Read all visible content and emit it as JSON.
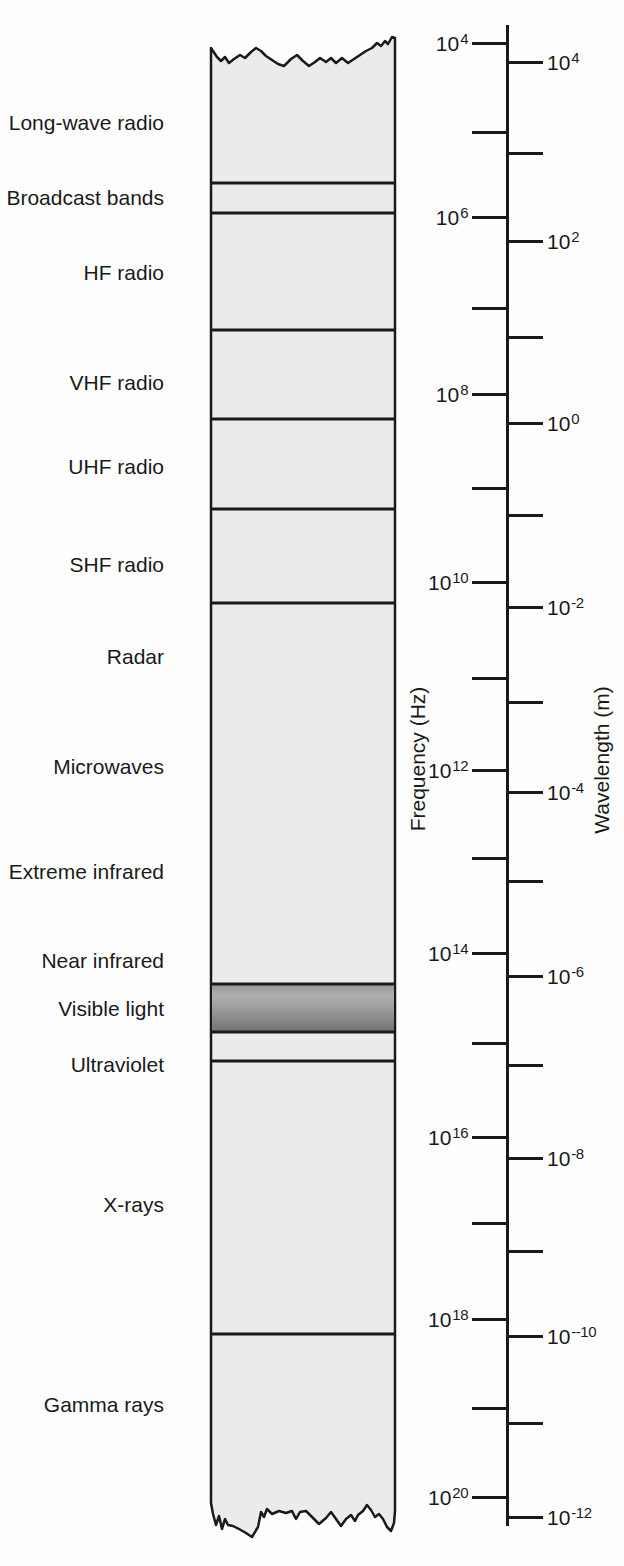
{
  "band": {
    "regions": [
      {
        "slug": "long-wave-radio",
        "label": "Long-wave radio",
        "label_y": 122,
        "top": 48,
        "bottom": 183
      },
      {
        "slug": "broadcast-bands",
        "label": "Broadcast bands",
        "label_y": 197,
        "top": 183,
        "bottom": 213
      },
      {
        "slug": "hf-radio",
        "label": "HF radio",
        "label_y": 272,
        "top": 213,
        "bottom": 330
      },
      {
        "slug": "vhf-radio",
        "label": "VHF radio",
        "label_y": 382,
        "top": 330,
        "bottom": 419
      },
      {
        "slug": "uhf-radio",
        "label": "UHF radio",
        "label_y": 466,
        "top": 419,
        "bottom": 509
      },
      {
        "slug": "shf-radio",
        "label": "SHF radio",
        "label_y": 564,
        "top": 509,
        "bottom": 603
      },
      {
        "slug": "radar",
        "label": "Radar",
        "label_y": 656,
        "top": 603,
        "bottom": 984
      },
      {
        "slug": "microwaves",
        "label": "Microwaves",
        "label_y": 766,
        "top": 603,
        "bottom": 984
      },
      {
        "slug": "extreme-infrared",
        "label": "Extreme infrared",
        "label_y": 871,
        "top": 603,
        "bottom": 984
      },
      {
        "slug": "near-infrared",
        "label": "Near infrared",
        "label_y": 960,
        "top": 603,
        "bottom": 984
      },
      {
        "slug": "visible-light",
        "label": "Visible light",
        "label_y": 1008,
        "top": 984,
        "bottom": 1032,
        "style": "gradient"
      },
      {
        "slug": "ultraviolet",
        "label": "Ultraviolet",
        "label_y": 1064,
        "top": 1032,
        "bottom": 1061
      },
      {
        "slug": "x-rays",
        "label": "X-rays",
        "label_y": 1204,
        "top": 1061,
        "bottom": 1334
      },
      {
        "slug": "gamma-rays",
        "label": "Gamma rays",
        "label_y": 1404,
        "top": 1334,
        "bottom": 1510
      }
    ],
    "boundary_lines_y": [
      183,
      213,
      330,
      419,
      509,
      603,
      984,
      1032,
      1061,
      1334
    ]
  },
  "axes": {
    "frequency": {
      "title": "Frequency (Hz)",
      "base": "10",
      "side": "left",
      "ticks": [
        {
          "exponent": "4",
          "y": 43,
          "labeled": true
        },
        {
          "exponent": "5",
          "y": 132,
          "labeled": false
        },
        {
          "exponent": "6",
          "y": 217,
          "labeled": true
        },
        {
          "exponent": "7",
          "y": 308,
          "labeled": false
        },
        {
          "exponent": "8",
          "y": 394,
          "labeled": true
        },
        {
          "exponent": "9",
          "y": 488,
          "labeled": false
        },
        {
          "exponent": "10",
          "y": 582,
          "labeled": true
        },
        {
          "exponent": "11",
          "y": 678,
          "labeled": false
        },
        {
          "exponent": "12",
          "y": 770,
          "labeled": true
        },
        {
          "exponent": "13",
          "y": 858,
          "labeled": false
        },
        {
          "exponent": "14",
          "y": 953,
          "labeled": true
        },
        {
          "exponent": "15",
          "y": 1043,
          "labeled": false
        },
        {
          "exponent": "16",
          "y": 1137,
          "labeled": true
        },
        {
          "exponent": "17",
          "y": 1223,
          "labeled": false
        },
        {
          "exponent": "18",
          "y": 1319,
          "labeled": true
        },
        {
          "exponent": "19",
          "y": 1408,
          "labeled": false
        },
        {
          "exponent": "20",
          "y": 1497,
          "labeled": true
        }
      ]
    },
    "wavelength": {
      "title": "Wavelength (m)",
      "base": "10",
      "side": "right",
      "ticks": [
        {
          "exponent": "4",
          "y": 62,
          "labeled": true
        },
        {
          "exponent": "3",
          "y": 153,
          "labeled": false
        },
        {
          "exponent": "2",
          "y": 241,
          "labeled": true
        },
        {
          "exponent": "1",
          "y": 337,
          "labeled": false
        },
        {
          "exponent": "0",
          "y": 423,
          "labeled": true
        },
        {
          "exponent": "-1",
          "y": 515,
          "labeled": false
        },
        {
          "exponent": "-2",
          "y": 607,
          "labeled": true
        },
        {
          "exponent": "-3",
          "y": 702,
          "labeled": false
        },
        {
          "exponent": "-4",
          "y": 792,
          "labeled": true
        },
        {
          "exponent": "-5",
          "y": 881,
          "labeled": false
        },
        {
          "exponent": "-6",
          "y": 976,
          "labeled": true
        },
        {
          "exponent": "-7",
          "y": 1065,
          "labeled": false
        },
        {
          "exponent": "-8",
          "y": 1158,
          "labeled": true
        },
        {
          "exponent": "-9",
          "y": 1251,
          "labeled": false
        },
        {
          "exponent": "--10",
          "y": 1336,
          "labeled": true
        },
        {
          "exponent": "-11",
          "y": 1423,
          "labeled": false
        },
        {
          "exponent": "-12",
          "y": 1517,
          "labeled": true
        }
      ]
    }
  },
  "colors": {
    "band_fill": "#ebebeb",
    "line": "#1a1a1a",
    "text": "#1a1a1a",
    "background": "#fefefe",
    "visible_gradient": [
      "#949494",
      "#aeaeae",
      "#a4a4a4",
      "#8a8a8a",
      "#717171"
    ]
  }
}
